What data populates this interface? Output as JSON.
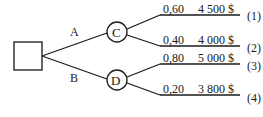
{
  "diagram": {
    "type": "decision-tree",
    "decision_node": {
      "label": ""
    },
    "alternatives": [
      {
        "label": "A",
        "chance_node": "C",
        "outcomes": [
          {
            "probability": "0,60",
            "value": "4 500 $",
            "id": "(1)"
          },
          {
            "probability": "0,40",
            "value": "4 000 $",
            "id": "(2)"
          }
        ]
      },
      {
        "label": "B",
        "chance_node": "D",
        "outcomes": [
          {
            "probability": "0,80",
            "value": "5 000 $",
            "id": "(3)"
          },
          {
            "probability": "0,20",
            "value": "3 800 $",
            "id": "(4)"
          }
        ]
      }
    ],
    "colors": {
      "line": "#1a1a1a",
      "background": "#ffffff"
    }
  }
}
